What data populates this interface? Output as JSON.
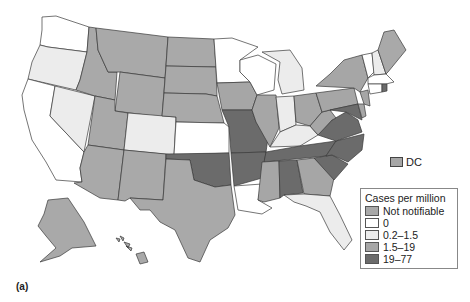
{
  "figure": {
    "caption": "(a)",
    "dc_label": "DC",
    "dc_color": "#a6a6a6"
  },
  "legend": {
    "title": "Cases per million",
    "items": [
      {
        "label": "Not notifiable",
        "color": "#a9a9a9"
      },
      {
        "label": "0",
        "color": "#ffffff"
      },
      {
        "label": "0.2–1.5",
        "color": "#ececec"
      },
      {
        "label": "1.5–19",
        "color": "#a6a6a6"
      },
      {
        "label": "19–77",
        "color": "#6b6b6b"
      }
    ]
  },
  "map": {
    "colors": {
      "not_notifiable": "#a9a9a9",
      "zero": "#ffffff",
      "low": "#ececec",
      "mid": "#a6a6a6",
      "high": "#6b6b6b"
    }
  }
}
